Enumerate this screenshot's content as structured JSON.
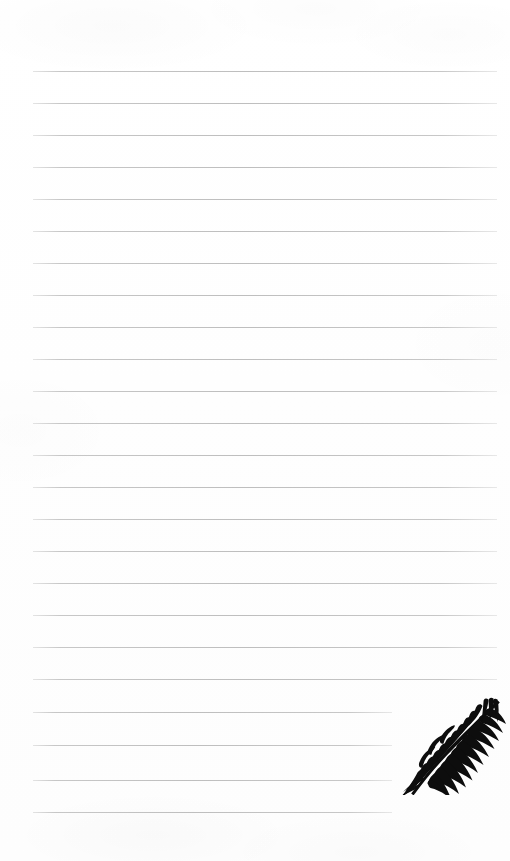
{
  "page": {
    "kind": "lined-notepad-page",
    "width": 510,
    "height": 861,
    "background_color": "#ffffff",
    "paper_tone": "#fdfdfd",
    "visible_text": "",
    "note": "Blank ruled stationery page — no written content present"
  },
  "ruling": {
    "line_color": "#c8c8c8",
    "line_thickness_px": 1,
    "line_count": 24,
    "first_line_y": 71,
    "line_spacing_px": 32,
    "left_margin_x": 33,
    "right_margin_x": 497,
    "truncated_right_x": 392,
    "truncated_from_index": 21,
    "lines": [
      {
        "index": 1,
        "y": 71,
        "x1": 33,
        "x2": 497,
        "truncated": false
      },
      {
        "index": 2,
        "y": 103,
        "x1": 33,
        "x2": 497,
        "truncated": false
      },
      {
        "index": 3,
        "y": 135,
        "x1": 33,
        "x2": 497,
        "truncated": false
      },
      {
        "index": 4,
        "y": 167,
        "x1": 33,
        "x2": 497,
        "truncated": false
      },
      {
        "index": 5,
        "y": 199,
        "x1": 33,
        "x2": 497,
        "truncated": false
      },
      {
        "index": 6,
        "y": 231,
        "x1": 33,
        "x2": 497,
        "truncated": false
      },
      {
        "index": 7,
        "y": 263,
        "x1": 33,
        "x2": 497,
        "truncated": false
      },
      {
        "index": 8,
        "y": 295,
        "x1": 33,
        "x2": 497,
        "truncated": false
      },
      {
        "index": 9,
        "y": 327,
        "x1": 33,
        "x2": 497,
        "truncated": false
      },
      {
        "index": 10,
        "y": 359,
        "x1": 33,
        "x2": 497,
        "truncated": false
      },
      {
        "index": 11,
        "y": 391,
        "x1": 33,
        "x2": 497,
        "truncated": false
      },
      {
        "index": 12,
        "y": 423,
        "x1": 33,
        "x2": 497,
        "truncated": false
      },
      {
        "index": 13,
        "y": 455,
        "x1": 33,
        "x2": 497,
        "truncated": false
      },
      {
        "index": 14,
        "y": 487,
        "x1": 33,
        "x2": 497,
        "truncated": false
      },
      {
        "index": 15,
        "y": 519,
        "x1": 33,
        "x2": 497,
        "truncated": false
      },
      {
        "index": 16,
        "y": 551,
        "x1": 33,
        "x2": 497,
        "truncated": false
      },
      {
        "index": 17,
        "y": 583,
        "x1": 33,
        "x2": 497,
        "truncated": false
      },
      {
        "index": 18,
        "y": 615,
        "x1": 33,
        "x2": 497,
        "truncated": false
      },
      {
        "index": 19,
        "y": 647,
        "x1": 33,
        "x2": 497,
        "truncated": false
      },
      {
        "index": 20,
        "y": 679,
        "x1": 33,
        "x2": 497,
        "truncated": false
      },
      {
        "index": 21,
        "y": 712,
        "x1": 33,
        "x2": 392,
        "truncated": true
      },
      {
        "index": 22,
        "y": 745,
        "x1": 33,
        "x2": 392,
        "truncated": true
      },
      {
        "index": 23,
        "y": 780,
        "x1": 33,
        "x2": 392,
        "truncated": true
      },
      {
        "index": 24,
        "y": 812,
        "x1": 33,
        "x2": 392,
        "truncated": true
      }
    ]
  },
  "decoration": {
    "name": "palm-frond-illustration",
    "style": "solid black silhouette, pinnate leaf",
    "color": "#0d0d0d",
    "position": {
      "x": 398,
      "y": 697,
      "width": 110,
      "height": 98
    },
    "orientation": "tip toward upper-right, stem toward lower-left",
    "leaflet_count": 34
  }
}
